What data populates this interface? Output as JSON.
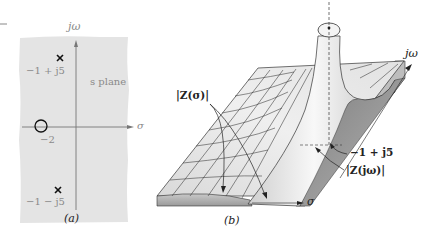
{
  "figure": {
    "panel_a": {
      "caption": "(a)",
      "plane_label": "s plane",
      "axes": {
        "vertical": "jω",
        "horizontal": "σ"
      },
      "poles": [
        {
          "label": "−1 + j5",
          "symbol": "×"
        },
        {
          "label": "−1 − j5",
          "symbol": "×"
        }
      ],
      "zeros": [
        {
          "label": "−2",
          "symbol": "○"
        }
      ],
      "colors": {
        "background": "#e4e4e4",
        "axis": "#777777",
        "marker": "#111111",
        "label": "#8a8a8a"
      }
    },
    "panel_b": {
      "caption": "(b)",
      "axes": {
        "jw": "jω",
        "sigma": "σ"
      },
      "annotations": {
        "z_sigma": "|Z(σ)|",
        "z_jw": "|Z(jω)|",
        "pole": "−1 + j5"
      },
      "colors": {
        "surface_light": "#f2f2f2",
        "surface_mid": "#cfcfcf",
        "surface_dark": "#8f8f8f",
        "grid": "#333333"
      }
    }
  }
}
